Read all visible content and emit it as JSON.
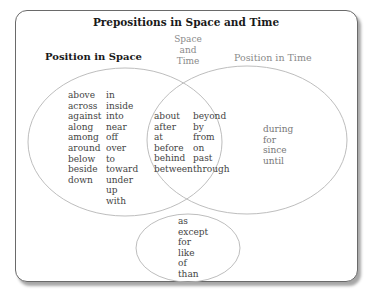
{
  "title": "Prepositions in Space and Time",
  "headers": {
    "space": "Position in Space",
    "both": [
      "Space",
      "and",
      "Time"
    ],
    "time": "Position in Time"
  },
  "space_only": {
    "col1": [
      "above",
      "across",
      "against",
      "along",
      "among",
      "around",
      "below",
      "beside",
      "down"
    ],
    "col2": [
      "in",
      "inside",
      "into",
      "near",
      "off",
      "over",
      "to",
      "toward",
      "under",
      "up",
      "with"
    ]
  },
  "space_and_time": {
    "col1": [
      "about",
      "after",
      "at",
      "before",
      "behind",
      "between"
    ],
    "col2": [
      "beyond",
      "by",
      "from",
      "on",
      "past",
      "through"
    ]
  },
  "time_only": [
    "during",
    "for",
    "since",
    "until"
  ],
  "neither": [
    "as",
    "except",
    "for",
    "like",
    "of",
    "than"
  ],
  "colors": {
    "border": "#6a6a6a",
    "circle": "#b5b5b5",
    "heading": "#1a1a1a",
    "muted": "#8a8a8a",
    "text": "#444444"
  }
}
